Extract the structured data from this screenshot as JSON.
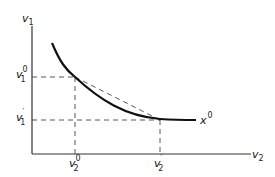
{
  "diagram": {
    "type": "indifference-curve",
    "axes": {
      "y_label": "v",
      "y_label_sub": "1",
      "x_label": "v",
      "x_label_sub": "2"
    },
    "curve_label": "x",
    "curve_label_sup": "0",
    "points": [
      {
        "id": "p0",
        "y_tick": "v",
        "y_tick_sub": "1",
        "y_tick_sup": "0",
        "x_tick": "v",
        "x_tick_sub": "2",
        "x_tick_sup": "0"
      },
      {
        "id": "p1",
        "y_tick": "v",
        "y_tick_sub": "1",
        "y_tick_sup": "′",
        "x_tick": "v",
        "x_tick_sub": "2",
        "x_tick_sup": "′"
      }
    ],
    "colors": {
      "curve": "#111111",
      "axes": "#333333",
      "dashed": "#444444"
    }
  }
}
